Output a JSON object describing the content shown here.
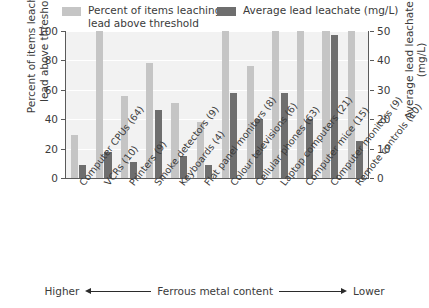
{
  "chart_data": {
    "type": "bar",
    "title": "",
    "categories": [
      "Computer CPUs (64)",
      "VCRs (10)",
      "Printers (9)",
      "Smoke detectors (9)",
      "Keyboards (4)",
      "Flat panel monitors (8)",
      "Colour televisions (6)",
      "Cellular phones (63)",
      "Laptop computers (21)",
      "Computer mice (15)",
      "Computer monitors (9)",
      "Remote controls (10)"
    ],
    "series": [
      {
        "name": "Percent of items leaching lead above threshold",
        "axis": "left",
        "color": "#c5c5c5",
        "values": [
          29,
          100,
          56,
          78,
          51,
          38,
          100,
          76,
          100,
          100,
          100,
          100
        ]
      },
      {
        "name": "Average lead leachate (mg/L)",
        "axis": "right",
        "color": "#6e6e6e",
        "values": [
          4.5,
          9.0,
          5.5,
          23.0,
          7.5,
          4.5,
          29.0,
          20.0,
          29.0,
          20.0,
          48.5,
          12.5
        ]
      }
    ],
    "ylabel": "Percent of items leaching lead above threshold",
    "ylabel_right": "Average lead leachate (mg/L)",
    "xlabel": "",
    "ylim": [
      0,
      100
    ],
    "ylim_right": [
      0,
      50
    ],
    "yticks": [
      0,
      20,
      40,
      60,
      80,
      100
    ],
    "yticks_right": [
      0,
      10,
      20,
      30,
      40,
      50
    ],
    "grid": true,
    "legend_position": "top"
  },
  "legend": {
    "items": [
      {
        "label": "Percent of items leaching\nlead above threshold",
        "color": "#c5c5c5"
      },
      {
        "label": "Average lead leachate (mg/L)",
        "color": "#6e6e6e"
      }
    ]
  },
  "axes": {
    "left_title": "Percent of items leaching\nlead above threshold",
    "right_title": "Average lead leachate (mg/L)",
    "left_ticks": [
      "100",
      "80",
      "60",
      "40",
      "20",
      "0"
    ],
    "right_ticks": [
      "50",
      "40",
      "30",
      "20",
      "10",
      "0"
    ]
  },
  "footer": {
    "left_label": "Higher",
    "center_label": "Ferrous metal content",
    "right_label": "Lower"
  }
}
